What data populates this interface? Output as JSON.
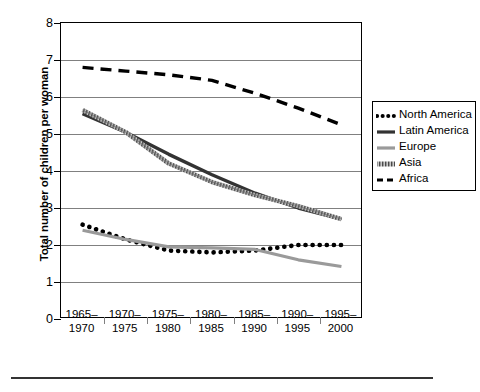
{
  "chart_data": {
    "type": "line",
    "title": "",
    "xlabel": "",
    "ylabel": "Total number of children per woman",
    "ylim": [
      0,
      8
    ],
    "ytick_step": 1,
    "yticks": [
      "0",
      "1",
      "2",
      "3",
      "4",
      "5",
      "6",
      "7",
      "8"
    ],
    "grid": true,
    "legend_position": "right",
    "categories": [
      "1965–\n1970",
      "1970–\n1975",
      "1975–\n1980",
      "1980–\n1985",
      "1985–\n1990",
      "1990–\n1995",
      "1995–\n2000"
    ],
    "category_lines": [
      [
        "1965–",
        "1970"
      ],
      [
        "1970–",
        "1975"
      ],
      [
        "1975–",
        "1980"
      ],
      [
        "1980–",
        "1985"
      ],
      [
        "1985–",
        "1990"
      ],
      [
        "1990–",
        "1995"
      ],
      [
        "1995–",
        "2000"
      ]
    ],
    "series": [
      {
        "name": "North America",
        "style": "dotted",
        "color": "#000000",
        "values": [
          2.55,
          2.15,
          1.85,
          1.8,
          1.85,
          2.0,
          2.0
        ]
      },
      {
        "name": "Latin America",
        "style": "solid",
        "color": "#333333",
        "values": [
          5.55,
          5.05,
          4.45,
          3.9,
          3.4,
          3.0,
          2.7
        ]
      },
      {
        "name": "Europe",
        "style": "solid",
        "color": "#9a9a9a",
        "values": [
          2.4,
          2.15,
          1.95,
          1.92,
          1.88,
          1.6,
          1.42
        ]
      },
      {
        "name": "Asia",
        "style": "hatched",
        "color": "#7a7a7a",
        "values": [
          5.65,
          5.05,
          4.2,
          3.7,
          3.35,
          3.05,
          2.7
        ]
      },
      {
        "name": "Africa",
        "style": "dashed",
        "color": "#000000",
        "values": [
          6.8,
          6.7,
          6.6,
          6.45,
          6.1,
          5.7,
          5.25
        ]
      }
    ]
  },
  "legend": {
    "items": [
      {
        "label": "North America"
      },
      {
        "label": "Latin America"
      },
      {
        "label": "Europe"
      },
      {
        "label": "Asia"
      },
      {
        "label": "Africa"
      }
    ]
  }
}
